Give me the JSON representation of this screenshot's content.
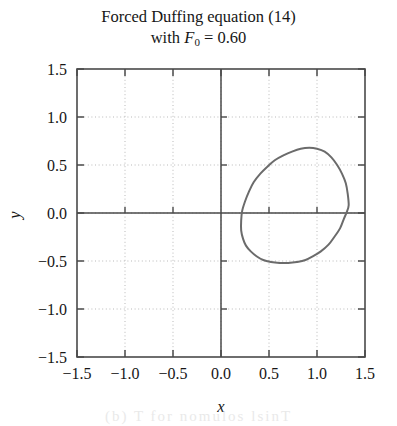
{
  "figure": {
    "title_line_1": "Forced Duffing equation (14)",
    "title_line_2_prefix": "with ",
    "title_line_2_symbol": "F",
    "title_line_2_subscript": "0",
    "title_line_2_suffix": " = 0.60",
    "background_color": "#ffffff",
    "frame_color": "#4a4a4a",
    "grid_color": "#b9b9b9",
    "curve_color": "#6b6b6b",
    "bleedthrough_artifact": "(b)        T         for nomulos lsinT"
  },
  "chart_data": {
    "type": "line",
    "xlabel": "x",
    "ylabel": "y",
    "xlim": [
      -1.5,
      1.5
    ],
    "ylim": [
      -1.5,
      1.5
    ],
    "grid": true,
    "legend": "none",
    "xticks": [
      -1.5,
      -1.0,
      -0.5,
      0.0,
      0.5,
      1.0,
      1.5
    ],
    "yticks": [
      -1.5,
      -1.0,
      -0.5,
      0.0,
      0.5,
      1.0,
      1.5
    ],
    "xtick_labels": [
      "-1.5",
      "-1.0",
      "-0.5",
      "0.0",
      "0.5",
      "1.0",
      "1.5"
    ],
    "ytick_labels": [
      "1.5",
      "1.0",
      "0.5",
      "0.0",
      "-0.5",
      "-1.0",
      "-1.5"
    ],
    "series": [
      {
        "name": "phase-portrait-limit-cycle",
        "closed": true,
        "color": "#6b6b6b",
        "linewidth": 2.0,
        "x": [
          1.33,
          1.32,
          1.3,
          1.26,
          1.21,
          1.15,
          1.08,
          1.0,
          0.92,
          0.83,
          0.74,
          0.65,
          0.56,
          0.48,
          0.41,
          0.34,
          0.29,
          0.25,
          0.22,
          0.21,
          0.21,
          0.23,
          0.26,
          0.31,
          0.37,
          0.44,
          0.52,
          0.61,
          0.7,
          0.79,
          0.88,
          0.96,
          1.04,
          1.12,
          1.18,
          1.24,
          1.28,
          1.31,
          1.33
        ],
        "y": [
          0.08,
          0.2,
          0.31,
          0.41,
          0.5,
          0.58,
          0.64,
          0.67,
          0.68,
          0.67,
          0.64,
          0.6,
          0.55,
          0.48,
          0.41,
          0.32,
          0.22,
          0.12,
          0.02,
          -0.08,
          -0.18,
          -0.27,
          -0.34,
          -0.4,
          -0.45,
          -0.49,
          -0.51,
          -0.52,
          -0.52,
          -0.51,
          -0.49,
          -0.45,
          -0.4,
          -0.33,
          -0.25,
          -0.16,
          -0.06,
          0.01,
          0.08
        ]
      }
    ]
  }
}
